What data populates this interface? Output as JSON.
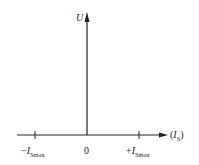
{
  "diagram": {
    "type": "characteristic-plot",
    "y_axis": {
      "label": "U"
    },
    "x_axis": {
      "label_prefix": "(",
      "label_main": "I",
      "label_sub": "S",
      "label_suffix": ")"
    },
    "ticks": [
      {
        "sign": "−",
        "main": "I",
        "sub": "Smax"
      },
      {
        "value": "0"
      },
      {
        "sign": "+",
        "main": "I",
        "sub": "Smax"
      }
    ],
    "line_color": "#222222"
  }
}
